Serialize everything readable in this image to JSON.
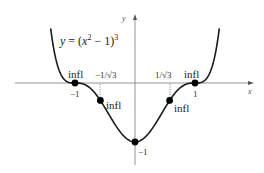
{
  "chart_data": {
    "type": "line",
    "title": "",
    "equation_label": "y = (x² − 1)³",
    "equation_parts": {
      "lhs": "y",
      "eq": " = (",
      "x": "x",
      "sq": "2",
      "mid": " − 1)",
      "cube": "3"
    },
    "xlabel": "x",
    "ylabel": "y",
    "function": "(x^2-1)^3",
    "xlim": [
      -2.0,
      2.0
    ],
    "ylim": [
      -1.2,
      1.1
    ],
    "grid": false,
    "legend": null,
    "x_tick_labels": [
      {
        "value": -1,
        "label": "−1"
      },
      {
        "value": -0.577,
        "label": "−1/√3"
      },
      {
        "value": 0.577,
        "label": "1/√3"
      },
      {
        "value": 1,
        "label": "1"
      }
    ],
    "y_tick_labels": [
      {
        "value": -1,
        "label": "−1"
      }
    ],
    "points": [
      {
        "x": -1,
        "y": 0,
        "label": "infl"
      },
      {
        "x": -0.577,
        "y": -0.296,
        "label": "infl"
      },
      {
        "x": 0,
        "y": -1,
        "label": ""
      },
      {
        "x": 0.577,
        "y": -0.296,
        "label": "infl"
      },
      {
        "x": 1,
        "y": 0,
        "label": "infl"
      }
    ],
    "series": [
      {
        "name": "y = (x^2 - 1)^3",
        "x": [
          -1.4,
          -1.3,
          -1.2,
          -1.1,
          -1.0,
          -0.9,
          -0.8,
          -0.7,
          -0.6,
          -0.5,
          -0.4,
          -0.3,
          -0.2,
          -0.1,
          0,
          0.1,
          0.2,
          0.3,
          0.4,
          0.5,
          0.6,
          0.7,
          0.8,
          0.9,
          1.0,
          1.1,
          1.2,
          1.3,
          1.4
        ],
        "values": [
          0.885,
          0.474,
          0.085,
          0.009,
          0,
          -0.007,
          -0.047,
          -0.133,
          -0.262,
          -0.422,
          -0.593,
          -0.754,
          -0.885,
          -0.97,
          -1,
          -0.97,
          -0.885,
          -0.754,
          -0.593,
          -0.422,
          -0.262,
          -0.133,
          -0.047,
          -0.007,
          0,
          0.009,
          0.085,
          0.474,
          0.885
        ]
      }
    ],
    "annotations": [
      {
        "text": "infl",
        "at": [
          -1,
          0
        ]
      },
      {
        "text": "infl",
        "at": [
          -0.577,
          -0.296
        ]
      },
      {
        "text": "infl",
        "at": [
          0.577,
          -0.296
        ]
      },
      {
        "text": "infl",
        "at": [
          1,
          0
        ]
      },
      {
        "text": "−1",
        "at": [
          0,
          -1
        ]
      }
    ],
    "colors": {
      "curve": "#1a1a1a",
      "axis": "#777777",
      "point": "#000000",
      "guide": "#555555"
    }
  },
  "labels": {
    "infl": "infl",
    "x_axis": "x",
    "y_axis": "y",
    "tick_neg1": "−1",
    "tick_pos1": "1",
    "tick_neg_inv_sqrt3": "−1/√3",
    "tick_pos_inv_sqrt3": "1/√3",
    "min_label": "−1"
  }
}
